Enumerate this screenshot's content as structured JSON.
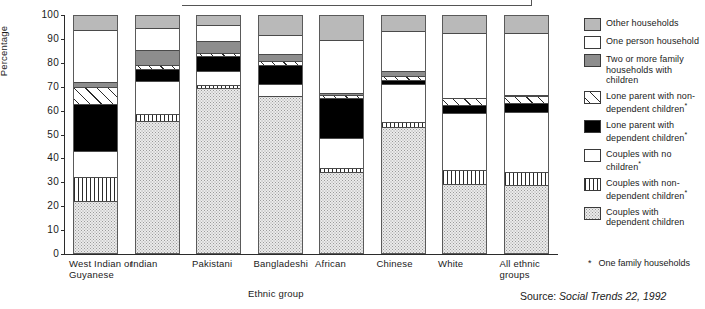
{
  "chart_data": {
    "type": "bar",
    "subtype": "stacked-100-percent",
    "title": "",
    "xlabel": "Ethnic group",
    "ylabel": "Percentage",
    "ylim": [
      0,
      100
    ],
    "yticks": [
      0,
      10,
      20,
      30,
      40,
      50,
      60,
      70,
      80,
      90,
      100
    ],
    "grid": false,
    "legend_position": "right",
    "categories": [
      "West Indian or Guyanese",
      "Indian",
      "Pakistani",
      "Bangladeshi",
      "African",
      "Chinese",
      "White",
      "All ethnic groups"
    ],
    "series": [
      {
        "name": "Couples with dependent children",
        "values": [
          22,
          55.5,
          69.5,
          66,
          34,
          53,
          29,
          29
        ]
      },
      {
        "name": "Couples with non-dependent children*",
        "values": [
          10,
          3,
          1.5,
          0,
          2,
          2,
          6,
          5.5
        ]
      },
      {
        "name": "Couples with no children*",
        "values": [
          11,
          14,
          6,
          5,
          12.5,
          16,
          24,
          25.5
        ]
      },
      {
        "name": "Lone parent with dependent children*",
        "values": [
          20,
          5,
          6,
          8,
          17,
          1.5,
          3.5,
          3.5
        ]
      },
      {
        "name": "Lone parent with non-dependent children*",
        "values": [
          7,
          2,
          1.5,
          1.5,
          1,
          2,
          3,
          3
        ]
      },
      {
        "name": "Two or more family households with children",
        "values": [
          2,
          6,
          5,
          3,
          1,
          2,
          0,
          0.5
        ]
      },
      {
        "name": "One person household",
        "values": [
          22,
          9.5,
          6.5,
          8,
          22.5,
          16.5,
          27.5,
          26.5
        ]
      },
      {
        "name": "Other households",
        "values": [
          6,
          5,
          4,
          8,
          10,
          6.5,
          7,
          7
        ]
      }
    ],
    "source": "Source: Social Trends 22, 1992",
    "footnote_marker": "*",
    "footnote_text": "One family households"
  },
  "legend": {
    "items": [
      {
        "label": "Other households",
        "pattern": "pat-other",
        "swatch_name": "legend-swatch-other-households"
      },
      {
        "label": "One person household",
        "pattern": "pat-oneperson",
        "swatch_name": "legend-swatch-one-person-household"
      },
      {
        "label": "Two or more family households with children",
        "pattern": "pat-twofam",
        "swatch_name": "legend-swatch-two-or-more-family-households"
      },
      {
        "label": "Lone parent with non-dependent children*",
        "pattern": "pat-lonenon",
        "swatch_name": "legend-swatch-lone-parent-non-dependent"
      },
      {
        "label": "Lone parent with dependent children*",
        "pattern": "pat-lonedep",
        "swatch_name": "legend-swatch-lone-parent-dependent"
      },
      {
        "label": "Couples with no children*",
        "pattern": "pat-couplenone",
        "swatch_name": "legend-swatch-couples-no-children"
      },
      {
        "label": "Couples with non-dependent children*",
        "pattern": "pat-couplenon",
        "swatch_name": "legend-swatch-couples-non-dependent"
      },
      {
        "label": "Couples with dependent children",
        "pattern": "pat-coupledep",
        "swatch_name": "legend-swatch-couples-dependent"
      }
    ]
  },
  "colors": {
    "other_households": "#b9b9b9",
    "two_or_more_family": "#8d8d8d",
    "lone_parent_dependent": "#000000",
    "couples_dependent": "#ebebeb",
    "axis": "#2b2b2b"
  }
}
